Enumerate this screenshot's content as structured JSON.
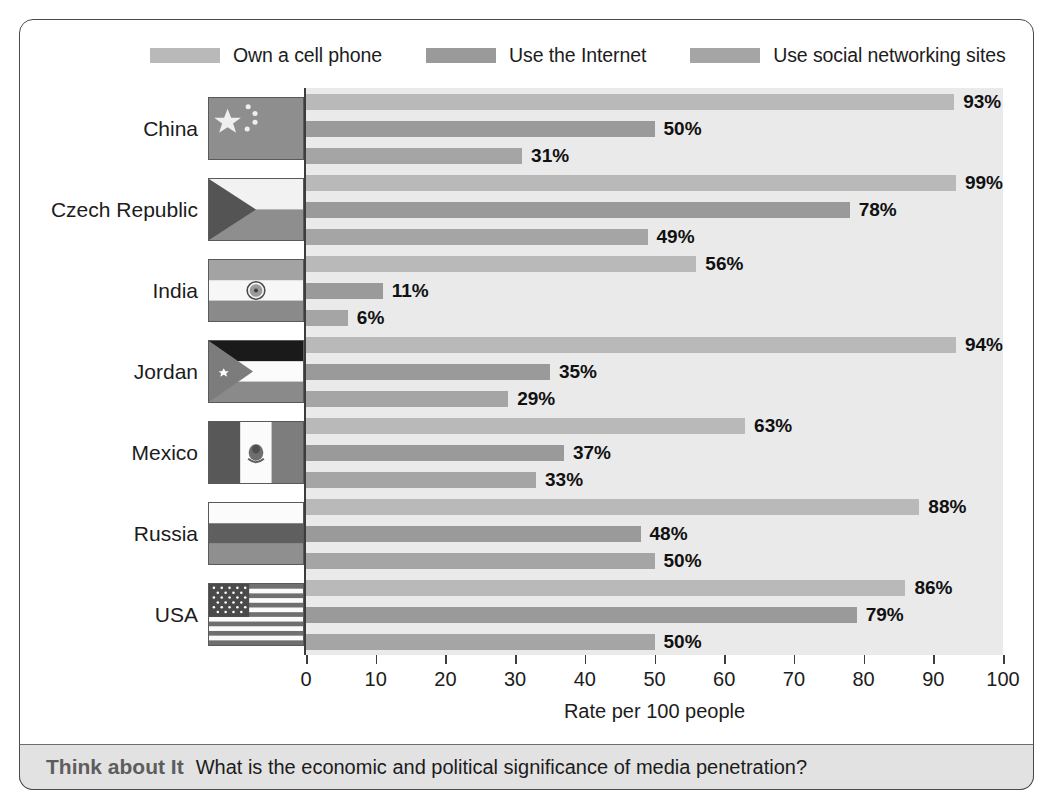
{
  "legend": {
    "items": [
      {
        "label": "Own a cell phone",
        "color": "#b9b9b9",
        "icon": "legend-swatch"
      },
      {
        "label": "Use the Internet",
        "color": "#9a9a9a",
        "icon": "legend-swatch"
      },
      {
        "label": "Use social networking sites",
        "color": "#a5a5a5",
        "icon": "legend-swatch"
      }
    ]
  },
  "caption": {
    "label": "Think about It",
    "text": "What is the economic and political significance of media penetration?"
  },
  "chart_data": {
    "type": "bar",
    "orientation": "horizontal",
    "title": "",
    "xlabel": "Rate per 100 people",
    "ylabel": "",
    "xlim": [
      0,
      100
    ],
    "xticks": [
      0,
      10,
      20,
      30,
      40,
      50,
      60,
      70,
      80,
      90,
      100
    ],
    "xtick_labels": [
      "0",
      "10",
      "20",
      "30",
      "40",
      "50",
      "60",
      "70",
      "80",
      "90",
      "100"
    ],
    "grid": false,
    "legend_position": "top",
    "value_suffix": "%",
    "categories": [
      "China",
      "Czech Republic",
      "India",
      "Jordan",
      "Mexico",
      "Russia",
      "USA"
    ],
    "series": [
      {
        "name": "Own a cell phone",
        "color": "#b9b9b9",
        "values": [
          93,
          99,
          56,
          94,
          63,
          88,
          86
        ]
      },
      {
        "name": "Use the Internet",
        "color": "#9a9a9a",
        "values": [
          50,
          78,
          11,
          35,
          37,
          48,
          79
        ]
      },
      {
        "name": "Use social networking sites",
        "color": "#a5a5a5",
        "values": [
          31,
          49,
          6,
          29,
          33,
          50,
          50
        ]
      }
    ],
    "rows": [
      {
        "country": "China",
        "flag": "flag-china",
        "values": [
          93,
          50,
          31
        ],
        "labels": [
          "93%",
          "50%",
          "31%"
        ]
      },
      {
        "country": "Czech Republic",
        "flag": "flag-czech-republic",
        "values": [
          99,
          78,
          49
        ],
        "labels": [
          "99%",
          "78%",
          "49%"
        ]
      },
      {
        "country": "India",
        "flag": "flag-india",
        "values": [
          56,
          11,
          6
        ],
        "labels": [
          "56%",
          "11%",
          "6%"
        ]
      },
      {
        "country": "Jordan",
        "flag": "flag-jordan",
        "values": [
          94,
          35,
          29
        ],
        "labels": [
          "94%",
          "35%",
          "29%"
        ]
      },
      {
        "country": "Mexico",
        "flag": "flag-mexico",
        "values": [
          63,
          37,
          33
        ],
        "labels": [
          "63%",
          "37%",
          "33%"
        ]
      },
      {
        "country": "Russia",
        "flag": "flag-russia",
        "values": [
          88,
          48,
          50
        ],
        "labels": [
          "88%",
          "48%",
          "50%"
        ]
      },
      {
        "country": "USA",
        "flag": "flag-usa",
        "values": [
          86,
          79,
          50
        ],
        "labels": [
          "86%",
          "79%",
          "50%"
        ]
      }
    ]
  },
  "colors": {
    "plot_background": "#eaeaea",
    "axis": "#3d3d3d",
    "frame": "#4a4a4a",
    "caption_background": "#e2e2e2",
    "caption_label": "#5d5d5d"
  }
}
